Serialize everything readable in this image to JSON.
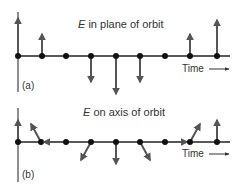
{
  "panels": [
    {
      "id": "a",
      "title": "E in plane of orbit",
      "panel_label": "(a)",
      "time_label": "Time",
      "axis_y": 56,
      "points": [
        {
          "x": 18,
          "dir": "up",
          "length": 38
        },
        {
          "x": 42,
          "dir": "up",
          "length": 22
        },
        {
          "x": 66,
          "dir": "none",
          "length": 0
        },
        {
          "x": 91,
          "dir": "down",
          "length": 26
        },
        {
          "x": 116,
          "dir": "down",
          "length": 38
        },
        {
          "x": 140,
          "dir": "down",
          "length": 26
        },
        {
          "x": 165,
          "dir": "none",
          "length": 0
        },
        {
          "x": 190,
          "dir": "up",
          "length": 22
        },
        {
          "x": 217,
          "dir": "up",
          "length": 36
        }
      ]
    },
    {
      "id": "b",
      "title": "E on axis of orbit",
      "panel_label": "(b)",
      "time_label": "Time",
      "axis_y": 142,
      "points": [
        {
          "x": 18,
          "dir": "up",
          "dx": 0,
          "dy": -22
        },
        {
          "x": 41,
          "dir": "up-left",
          "dx": -11,
          "dy": -18
        },
        {
          "x": 66,
          "dir": "left",
          "dx": -22,
          "dy": 0
        },
        {
          "x": 91,
          "dir": "down-left",
          "dx": -10,
          "dy": 0,
          "ddy": 18
        },
        {
          "x": 116,
          "dir": "down",
          "dx": 0,
          "dy": 22
        },
        {
          "x": 140,
          "dir": "down-right",
          "dx": 11,
          "dy": 18
        },
        {
          "x": 165,
          "dir": "right",
          "dx": 22,
          "dy": 0
        },
        {
          "x": 190,
          "dir": "up-right",
          "dx": 11,
          "dy": -18
        },
        {
          "x": 217,
          "dir": "up",
          "dx": 0,
          "dy": -22
        }
      ]
    }
  ],
  "colors": {
    "line": "#222222",
    "arrow": "#555555",
    "dot": "#111111",
    "text": "#333333"
  }
}
